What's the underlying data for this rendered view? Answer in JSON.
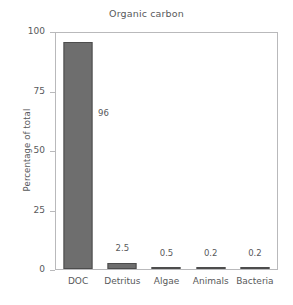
{
  "chart_data": {
    "type": "bar",
    "title": "Organic carbon",
    "xlabel": "",
    "ylabel": "Percentage of total",
    "categories": [
      "DOC",
      "Detritus",
      "Algae",
      "Animals",
      "Bacteria"
    ],
    "values": [
      96,
      2.5,
      0.5,
      0.2,
      0.2
    ],
    "value_labels": [
      "96",
      "2.5",
      "0.5",
      "0.2",
      "0.2"
    ],
    "ylim": [
      0,
      100
    ],
    "yticks": [
      0,
      25,
      50,
      75,
      100
    ],
    "ytick_labels": [
      "0",
      "25",
      "50",
      "75",
      "100"
    ],
    "grid": false,
    "legend": "none",
    "bar_color": "#6e6e6e",
    "bar_edge_color": "#4d4d4d",
    "axis_color": "#b9b9bb",
    "text_color": "#58595b",
    "background": "#ffffff"
  }
}
